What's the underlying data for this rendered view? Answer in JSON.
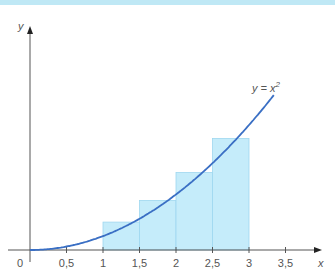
{
  "chart_data": {
    "type": "line",
    "title": "",
    "xlabel": "x",
    "ylabel": "y",
    "origin_label": "0",
    "x_ticks": [
      0.5,
      1,
      1.5,
      2,
      2.5,
      3,
      3.5
    ],
    "x_tick_labels": [
      "0,5",
      "1",
      "1,5",
      "2",
      "2,5",
      "3",
      "3,5"
    ],
    "xlim": [
      0,
      3.9
    ],
    "ylim": [
      0,
      15
    ],
    "grid": false,
    "series": [
      {
        "name": "y = x²",
        "function": "x^2",
        "x_range": [
          0,
          3.35
        ],
        "color": "#3a6fc4"
      }
    ],
    "rectangles": {
      "description": "upper Riemann sum rectangles of width 0.5 on [1,3]",
      "color": "#c5ecfa",
      "bars": [
        {
          "x0": 1,
          "x1": 1.5,
          "height": 2.25
        },
        {
          "x0": 1.5,
          "x1": 2,
          "height": 4
        },
        {
          "x0": 2,
          "x1": 2.5,
          "height": 6.25
        },
        {
          "x0": 2.5,
          "x1": 3,
          "height": 9
        }
      ]
    },
    "annotations": [
      {
        "text": "y = x",
        "superscript": "2",
        "near_x": 3.3
      }
    ]
  },
  "colors": {
    "curve": "#3a6fc4",
    "bars": "#c5ecfa",
    "bar_edge": "#9fd8ef",
    "axis": "#555555",
    "topbar": "#bfe8f5"
  }
}
